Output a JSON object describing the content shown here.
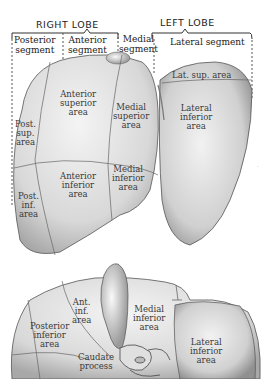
{
  "headers": {
    "right_lobe": "RIGHT LOBE",
    "left_lobe": "LEFT LOBE"
  },
  "segments": {
    "posterior": "Posterior\nsegment",
    "anterior": "Anterior\nsegment",
    "medial": "Medial\nsegment",
    "lateral": "Lateral segment"
  },
  "superior_view": {
    "areas": {
      "anterior_superior": "Anterior\nsuperior\narea",
      "medial_superior": "Medial\nsuperior\narea",
      "post_sup": "Post.\nsup.\narea",
      "anterior_inferior": "Anterior\ninferior\narea",
      "medial_inferior": "Medial\ninferior\narea",
      "post_inf": "Post.\ninf.\narea",
      "lat_sup": "Lat. sup. area",
      "lateral_inferior": "Lateral\ninferior\narea"
    }
  },
  "inferior_view": {
    "areas": {
      "ant_inf": "Ant.\ninf.\narea",
      "medial_inferior": "Medial\ninferior\narea",
      "posterior_inferior": "Posterior\ninferior\narea",
      "caudate_process": "Caudate\nprocess",
      "lateral_inferior": "Lateral\ninferior\narea"
    }
  }
}
